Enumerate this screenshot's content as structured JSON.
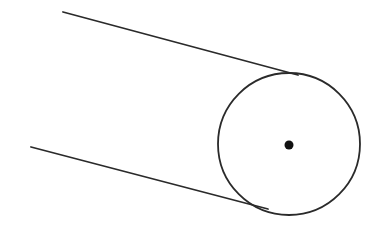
{
  "diagram": {
    "width": 382,
    "height": 226,
    "stroke_color": "#2a2a2a",
    "background": "#ffffff",
    "circle": {
      "cx": 289,
      "cy": 144,
      "r": 71
    },
    "center_dot": {
      "cx": 289,
      "cy": 145,
      "r": 4.5
    },
    "upper_tangent_line": {
      "x1": 63,
      "y1": 12,
      "x2": 298,
      "y2": 75
    },
    "lower_tangent_line": {
      "x1": 31,
      "y1": 147,
      "x2": 268,
      "y2": 209
    }
  }
}
